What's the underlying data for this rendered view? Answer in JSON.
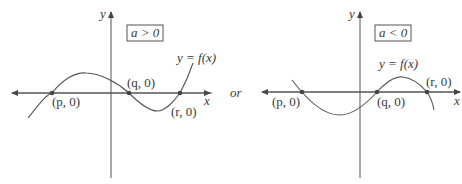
{
  "separator": "or",
  "graphs": [
    {
      "condition": "a > 0",
      "axis_x_label": "x",
      "axis_y_label": "y",
      "function_label": "y = f(x)",
      "points": [
        {
          "label": "(p, 0)"
        },
        {
          "label": "(q, 0)"
        },
        {
          "label": "(r, 0)"
        }
      ]
    },
    {
      "condition": "a < 0",
      "axis_x_label": "x",
      "axis_y_label": "y",
      "function_label": "y = f(x)",
      "points": [
        {
          "label": "(p, 0)"
        },
        {
          "label": "(q, 0)"
        },
        {
          "label": "(r, 0)"
        }
      ]
    }
  ],
  "colors": {
    "line": "#555555",
    "text": "#3a3a3a",
    "point": "#444444"
  }
}
